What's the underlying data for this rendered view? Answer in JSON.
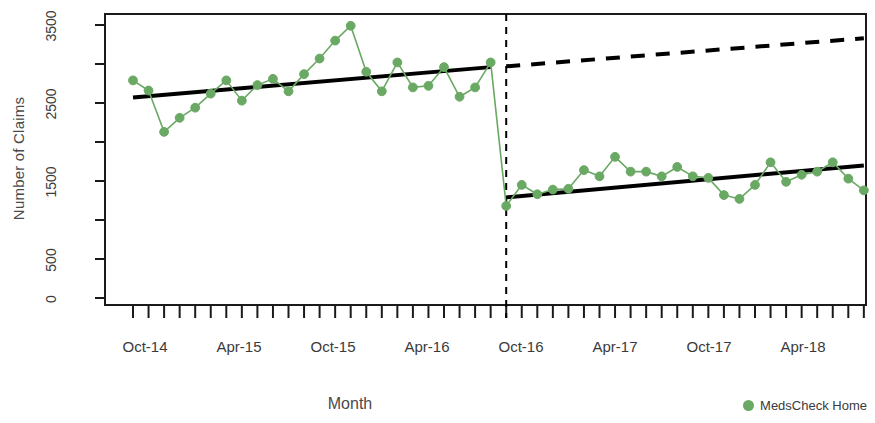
{
  "chart_data": {
    "type": "line",
    "title": "",
    "xlabel": "Month",
    "ylabel": "Number of Claims",
    "ylim": [
      0,
      3500
    ],
    "yticks": [
      0,
      500,
      1500,
      2500,
      3500
    ],
    "yticks_minor": [
      1000,
      2000,
      3000
    ],
    "grid": false,
    "legend_position": "bottom-right",
    "legend": [
      "MedsCheck Home"
    ],
    "series_color": "#6aa964",
    "trend_color": "#000000",
    "x_tick_labels": [
      "Oct-14",
      "Apr-15",
      "Oct-15",
      "Apr-16",
      "Oct-16",
      "Apr-17",
      "Oct-17",
      "Apr-18"
    ],
    "x_tick_label_months": [
      "2014-10",
      "2015-04",
      "2015-10",
      "2016-04",
      "2016-10",
      "2017-04",
      "2017-10",
      "2018-04"
    ],
    "x_months_total": 48,
    "x_start_month": "2014-10",
    "x_end_month": "2018-09",
    "intervention": {
      "label": "Oct-16",
      "month_index": 24,
      "line_style": "dashed",
      "color": "#000000"
    },
    "series": [
      {
        "name": "MedsCheck Home",
        "x": [
          "2014-10",
          "2014-11",
          "2014-12",
          "2015-01",
          "2015-02",
          "2015-03",
          "2015-04",
          "2015-05",
          "2015-06",
          "2015-07",
          "2015-08",
          "2015-09",
          "2015-10",
          "2015-11",
          "2015-12",
          "2016-01",
          "2016-02",
          "2016-03",
          "2016-04",
          "2016-05",
          "2016-06",
          "2016-07",
          "2016-08",
          "2016-09",
          "2016-10",
          "2016-11",
          "2016-12",
          "2017-01",
          "2017-02",
          "2017-03",
          "2017-04",
          "2017-05",
          "2017-06",
          "2017-07",
          "2017-08",
          "2017-09",
          "2017-10",
          "2017-11",
          "2017-12",
          "2018-01",
          "2018-02",
          "2018-03",
          "2018-04",
          "2018-05",
          "2018-06",
          "2018-07",
          "2018-08",
          "2018-09"
        ],
        "values": [
          2790,
          2660,
          2130,
          2310,
          2440,
          2620,
          2790,
          2530,
          2730,
          2810,
          2650,
          2870,
          3070,
          3300,
          3490,
          2900,
          2650,
          3020,
          2700,
          2720,
          2960,
          2580,
          2700,
          3020,
          1180,
          1450,
          1330,
          1390,
          1400,
          1640,
          1560,
          1810,
          1620,
          1620,
          1560,
          1680,
          1560,
          1540,
          1320,
          1270,
          1450,
          1740,
          1490,
          1580,
          1620,
          1740,
          1530,
          1380
        ]
      }
    ],
    "fitted_lines": [
      {
        "name": "pre-intervention-trend",
        "style": "solid",
        "from": {
          "month": "2014-10",
          "value": 2570
        },
        "to": {
          "month": "2016-09",
          "value": 2960
        }
      },
      {
        "name": "post-intervention-trend",
        "style": "solid",
        "from": {
          "month": "2016-10",
          "value": 1290
        },
        "to": {
          "month": "2018-09",
          "value": 1700
        }
      },
      {
        "name": "counterfactual-trend",
        "style": "dashed",
        "from": {
          "month": "2016-10",
          "value": 2970
        },
        "to": {
          "month": "2018-09",
          "value": 3330
        }
      }
    ]
  },
  "axis": {
    "y_label": "Number of Claims",
    "x_label": "Month"
  },
  "legend": {
    "items": [
      {
        "label": "MedsCheck Home",
        "color": "#6aa964",
        "marker": "circle"
      }
    ]
  }
}
